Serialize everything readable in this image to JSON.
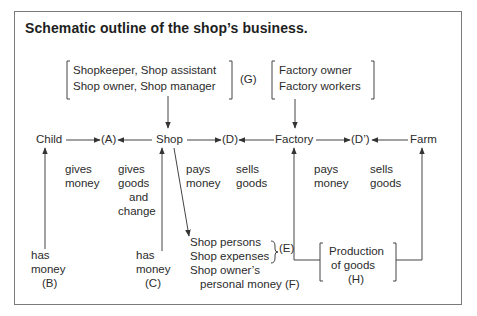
{
  "title": "Schematic outline of the shop’s business.",
  "groups": {
    "shop_staff": {
      "line1": "Shopkeeper, Shop assistant",
      "line2": "Shop owner, Shop manager",
      "label": "(G)"
    },
    "factory_staff": {
      "line1": "Factory owner",
      "line2": "Factory workers"
    },
    "production": {
      "line1": "Production",
      "line2": "of goods",
      "label": "(H)"
    }
  },
  "nodes": {
    "child": "Child",
    "a": "(A)",
    "shop": "Shop",
    "d": "(D)",
    "factory": "Factory",
    "d_prime": "(D’)",
    "farm": "Farm"
  },
  "flow_labels": {
    "child_gives": {
      "line1": "gives",
      "line2": "money"
    },
    "shop_gives": {
      "line1": "gives",
      "line2": "goods",
      "line3": "and",
      "line4": "change"
    },
    "shop_pays": {
      "line1": "pays",
      "line2": "money"
    },
    "factory_sells": {
      "line1": "sells",
      "line2": "goods"
    },
    "factory_pays": {
      "line1": "pays",
      "line2": "money"
    },
    "farm_sells": {
      "line1": "sells",
      "line2": "goods"
    }
  },
  "sources": {
    "b": {
      "line1": "has",
      "line2": "money",
      "label": "(B)"
    },
    "c": {
      "line1": "has",
      "line2": "money",
      "label": "(C)"
    }
  },
  "shop_outputs": {
    "line1": "Shop persons",
    "line2": "Shop expenses",
    "e_label": "(E)",
    "line3": "Shop owner’s",
    "line4": "personal money (F)"
  },
  "colors": {
    "line": "#444444",
    "text": "#2b2b2b",
    "frame": "#7a7a7a"
  }
}
